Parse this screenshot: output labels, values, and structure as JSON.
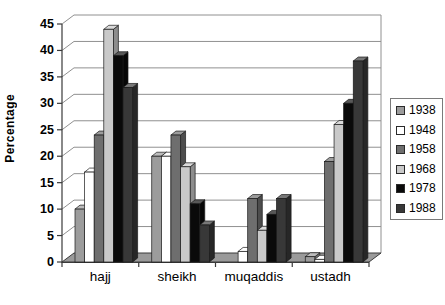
{
  "chart_data": {
    "type": "bar",
    "subtype": "3d-clustered-column",
    "title": "",
    "xlabel": "",
    "ylabel": "Percentage",
    "categories": [
      "hajj",
      "sheikh",
      "muqaddis",
      "ustadh"
    ],
    "series": [
      {
        "name": "1938",
        "color": "#9c9c9c",
        "values": [
          10,
          20,
          0,
          1
        ]
      },
      {
        "name": "1948",
        "color": "#ffffff",
        "values": [
          17,
          20,
          2,
          0.5
        ]
      },
      {
        "name": "1958",
        "color": "#6e6e6e",
        "values": [
          24,
          24,
          12,
          19
        ]
      },
      {
        "name": "1968",
        "color": "#c9c9c9",
        "values": [
          44,
          18,
          6,
          26
        ]
      },
      {
        "name": "1978",
        "color": "#0a0a0a",
        "values": [
          39,
          11,
          9,
          30
        ]
      },
      {
        "name": "1988",
        "color": "#383838",
        "values": [
          33,
          7,
          12,
          38
        ]
      }
    ],
    "ylim": [
      0,
      45
    ],
    "ytick_step": 5,
    "grid": true,
    "grid_color": "#909090",
    "axis_color": "#3a3a3a",
    "floor_color": "#9a9a9a",
    "legend_position": "right",
    "legend_labels": [
      "1938",
      "1948",
      "1958",
      "1968",
      "1978",
      "1988"
    ]
  }
}
